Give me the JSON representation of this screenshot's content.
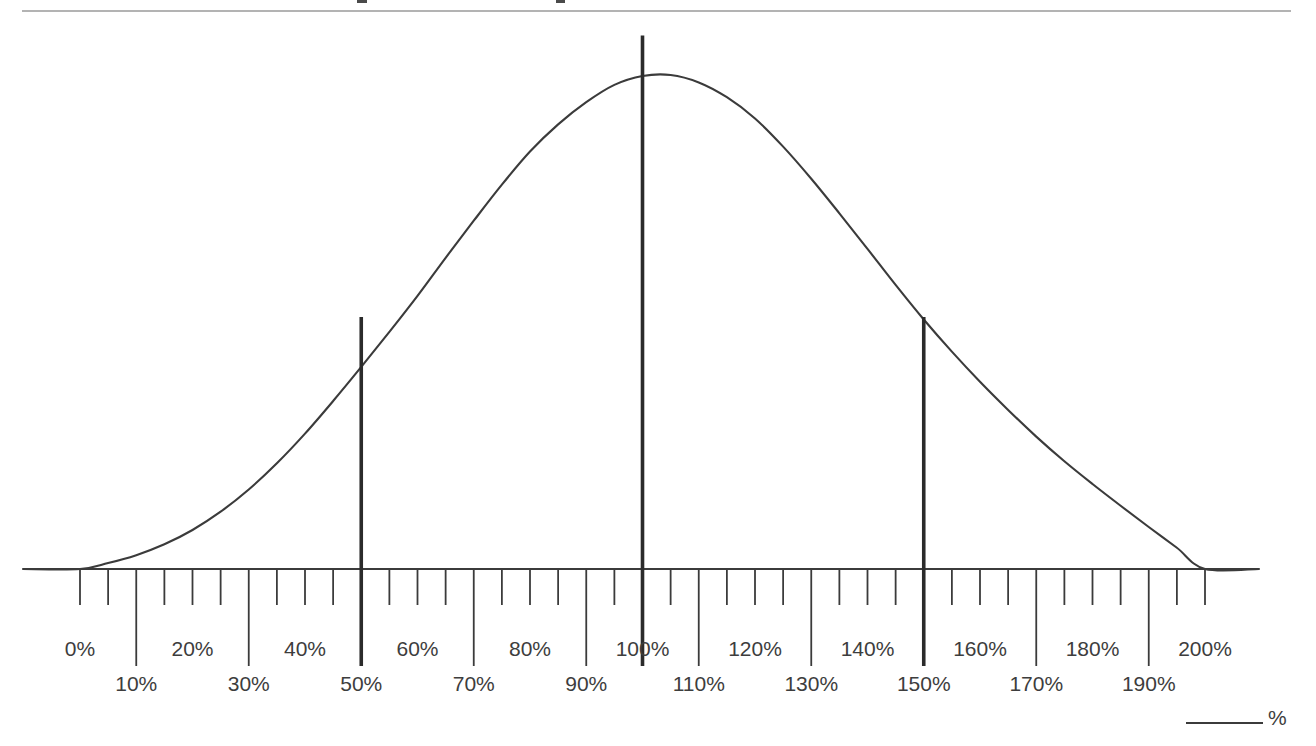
{
  "page": {
    "background_color": "#ffffff",
    "ink_color": "#3b3b3b",
    "rule_color": "#9a9a9a"
  },
  "axis_caption": {
    "unit_label": "%",
    "leader_line": "leader-line"
  },
  "chart_data": {
    "type": "line",
    "title": "",
    "subtitle": "",
    "xlabel": "%",
    "ylabel": "",
    "grid": false,
    "legend": null,
    "xlim": [
      -2.5,
      202.5
    ],
    "ylim": [
      0,
      1
    ],
    "x_tick_step": 5,
    "x_major_labels_upper": [
      "0%",
      "20%",
      "40%",
      "60%",
      "80%",
      "100%",
      "120%",
      "140%",
      "160%",
      "180%",
      "200%"
    ],
    "x_major_values_upper": [
      0,
      20,
      40,
      60,
      80,
      100,
      120,
      140,
      160,
      180,
      200
    ],
    "x_major_labels_lower": [
      "10%",
      "30%",
      "50%",
      "70%",
      "90%",
      "110%",
      "130%",
      "150%",
      "170%",
      "190%"
    ],
    "x_major_values_lower": [
      10,
      30,
      50,
      70,
      90,
      110,
      130,
      150,
      170,
      190
    ],
    "markers": [
      {
        "label": "50%",
        "value": 50,
        "height_fraction": 0.51
      },
      {
        "label": "100%",
        "value": 100,
        "height_fraction": 1.08
      },
      {
        "label": "150%",
        "value": 150,
        "height_fraction": 0.51
      }
    ],
    "series": [
      {
        "name": "distribution",
        "x": [
          0,
          5,
          10,
          15,
          20,
          25,
          30,
          35,
          40,
          45,
          50,
          55,
          60,
          65,
          70,
          75,
          80,
          85,
          90,
          95,
          100,
          105,
          110,
          115,
          120,
          125,
          130,
          135,
          140,
          145,
          150,
          155,
          160,
          165,
          170,
          175,
          180,
          185,
          190,
          195,
          200
        ],
        "y": [
          0.0,
          0.012,
          0.028,
          0.05,
          0.079,
          0.116,
          0.161,
          0.214,
          0.274,
          0.34,
          0.409,
          0.48,
          0.553,
          0.63,
          0.705,
          0.778,
          0.845,
          0.9,
          0.945,
          0.98,
          0.998,
          1.0,
          0.985,
          0.955,
          0.912,
          0.855,
          0.79,
          0.72,
          0.648,
          0.575,
          0.505,
          0.44,
          0.379,
          0.322,
          0.268,
          0.218,
          0.172,
          0.128,
          0.085,
          0.043,
          0.0
        ]
      }
    ]
  }
}
